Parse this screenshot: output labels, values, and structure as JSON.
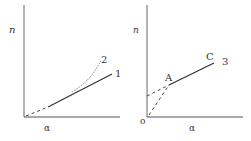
{
  "diagram": {
    "panels": [
      {
        "id": "left",
        "y_axis_label": "n",
        "x_axis_label": "α",
        "curves": [
          {
            "label": "1",
            "style": "solid with dashed extrapolation to origin",
            "type": "straight line"
          },
          {
            "label": "2",
            "style": "dotted",
            "type": "upward-curving line"
          }
        ]
      },
      {
        "id": "right",
        "y_axis_label": "n",
        "x_axis_label": "α",
        "origin_label": "o",
        "points": [
          {
            "label": "A"
          },
          {
            "label": "C"
          }
        ],
        "curves": [
          {
            "label": "3",
            "style": "solid segment A–C with dashed extrapolations to y-axis and origin",
            "type": "straight line"
          }
        ]
      }
    ],
    "colors": {
      "axis": "#555555",
      "line": "#333333",
      "text": "#333333"
    }
  }
}
